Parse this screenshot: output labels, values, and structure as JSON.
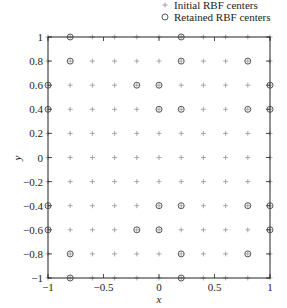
{
  "chart_data": {
    "type": "scatter",
    "title": "",
    "xlabel": "x",
    "ylabel": "y",
    "xlim": [
      -1,
      1
    ],
    "ylim": [
      -1,
      1
    ],
    "grid": false,
    "legend_placement": "top-right-outside",
    "x_ticks": [
      -1,
      -0.5,
      0,
      0.5,
      1
    ],
    "x_tick_labels": [
      "−1",
      "−0.5",
      "0",
      "0.5",
      "1"
    ],
    "y_ticks": [
      1,
      0.8,
      0.6,
      0.4,
      0.2,
      0,
      -0.2,
      -0.4,
      -0.6,
      -0.8,
      -1
    ],
    "y_tick_labels": [
      "1",
      "0.8",
      "0.6",
      "0.4",
      "0.2",
      "0",
      "−0.2",
      "−0.4",
      "−0.6",
      "−0.8",
      "−1"
    ],
    "series": [
      {
        "name": "Initial RBF centers",
        "marker": "plus",
        "color": "#888888",
        "grid": {
          "x": [
            -1,
            -0.8,
            -0.6,
            -0.4,
            -0.2,
            0,
            0.2,
            0.4,
            0.6,
            0.8,
            1
          ],
          "y": [
            -1,
            -0.8,
            -0.6,
            -0.4,
            -0.2,
            0,
            0.2,
            0.4,
            0.6,
            0.8,
            1
          ]
        }
      },
      {
        "name": "Retained RBF centers",
        "marker": "circle",
        "color": "#444444",
        "points": [
          [
            -0.8,
            1
          ],
          [
            0.2,
            1
          ],
          [
            -0.8,
            0.8
          ],
          [
            0.2,
            0.8
          ],
          [
            0.8,
            0.8
          ],
          [
            -1,
            0.6
          ],
          [
            -0.2,
            0.6
          ],
          [
            0,
            0.6
          ],
          [
            1,
            0.6
          ],
          [
            -1,
            0.4
          ],
          [
            0,
            0.4
          ],
          [
            0.2,
            0.4
          ],
          [
            0.8,
            0.4
          ],
          [
            1,
            0.4
          ],
          [
            -1,
            -0.4
          ],
          [
            0,
            -0.4
          ],
          [
            0.2,
            -0.4
          ],
          [
            0.8,
            -0.4
          ],
          [
            1,
            -0.4
          ],
          [
            -1,
            -0.6
          ],
          [
            -0.2,
            -0.6
          ],
          [
            0,
            -0.6
          ],
          [
            1,
            -0.6
          ],
          [
            -0.8,
            -0.8
          ],
          [
            0.2,
            -0.8
          ],
          [
            0.8,
            -0.8
          ],
          [
            -0.8,
            -1
          ],
          [
            0.2,
            -1
          ]
        ]
      }
    ]
  },
  "legend": {
    "items": [
      {
        "label": "Initial RBF centers"
      },
      {
        "label": "Retained RBF centers"
      }
    ]
  }
}
